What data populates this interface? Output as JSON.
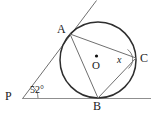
{
  "figure": {
    "type": "circle-geometry-diagram",
    "background_color": "#ffffff",
    "stroke_color": "#3a3a3a",
    "thin_stroke_color": "#6b6b6b",
    "baseline_color": "#8a8a8a",
    "label_color": "#1a1a1a"
  },
  "labels": {
    "point_a": "A",
    "point_b": "B",
    "point_c": "C",
    "point_p": "P",
    "center_o": "O",
    "angle_p": "52°",
    "angle_x": "x"
  },
  "geometry": {
    "circle": {
      "cx": 98,
      "cy": 60,
      "r": 38
    },
    "points": {
      "A": {
        "x": 70,
        "y": 34
      },
      "B": {
        "x": 98,
        "y": 98
      },
      "C": {
        "x": 136,
        "y": 58
      },
      "P": {
        "x": 23,
        "y": 98
      },
      "O": {
        "x": 96,
        "y": 57
      }
    },
    "lines": [
      {
        "name": "tangent-line-at-b",
        "x1": 22,
        "y1": 98,
        "x2": 151,
        "y2": 98
      },
      {
        "name": "secant-line-p-through-a",
        "x1": 23,
        "y1": 98,
        "x2": 96,
        "y2": 1
      },
      {
        "name": "chord-a-to-c",
        "x1": 70,
        "y1": 34,
        "x2": 136,
        "y2": 58
      },
      {
        "name": "chord-a-to-b",
        "x1": 70,
        "y1": 34,
        "x2": 98,
        "y2": 98
      },
      {
        "name": "chord-b-to-c",
        "x1": 98,
        "y1": 98,
        "x2": 136,
        "y2": 58
      }
    ]
  },
  "label_positions": {
    "A": {
      "left": 57,
      "top": 23
    },
    "B": {
      "left": 93,
      "top": 101
    },
    "C": {
      "left": 140,
      "top": 52
    },
    "P": {
      "left": 6,
      "top": 90
    },
    "O": {
      "left": 92,
      "top": 60
    },
    "angle_p": {
      "left": 30,
      "top": 86
    },
    "angle_x": {
      "left": 117,
      "top": 55
    }
  }
}
